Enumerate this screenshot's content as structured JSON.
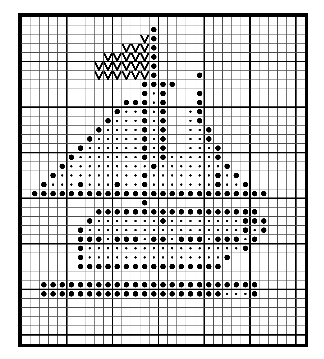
{
  "document": {
    "title": "Cross Stitch Pattern Chart",
    "caption": ""
  },
  "chart": {
    "kind": "needlework-grid-chart",
    "columns": 31,
    "rows": 36,
    "cell_size_px": 9.0,
    "major_line_every": 5,
    "colors": {
      "background": "#ffffff",
      "minor_line": "#4a4a4a",
      "major_line": "#000000",
      "border": "#000000",
      "symbol": "#000000"
    },
    "symbols": {
      "O": {
        "name": "large-filled-dot",
        "label": "large dot"
      },
      "o": {
        "name": "small-filled-dot",
        "label": "small dot"
      },
      "V": {
        "name": "v-stitch-mark",
        "label": "V"
      },
      ".": {
        "name": "empty-cell",
        "label": "empty"
      }
    },
    "legend": [
      {
        "symbol": "O",
        "name": "large-filled-dot",
        "label": "large dot"
      },
      {
        "symbol": "o",
        "name": "small-filled-dot",
        "label": "small dot"
      },
      {
        "symbol": "V",
        "name": "v-stitch-mark",
        "label": "V"
      }
    ]
  },
  "chart_data": {
    "type": "heatmap",
    "xlabel": "",
    "ylabel": "",
    "grid": true,
    "legend_position": "none",
    "categories": [],
    "values": [],
    "cells": [
      "...............................",
      "..............O................",
      ".............VO................",
      "...........VVVO................",
      ".........VVVVVO................",
      "........VVVVVVO................",
      "........VVVVVVO....O...........",
      ".............OOOO..............",
      ".............OoO...O...........",
      "...........OOOoO...O...........",
      "..........OooOoO..oO...........",
      ".........OoooOoO..oO...........",
      "........OooooOoO..ooO..........",
      ".......OoooooOoO..ooO..........",
      "......OooooooOoO..oooO.........",
      ".....OoooooooOoOoooooO.........",
      "....OoooooooooOoooooooO........",
      "...OoooooooooOoooooooOoO.......",
      "..OoooOoooOooOoooooooOooO......",
      ".OOOOOOOOOOOOOOOOOOOOOOOOOO....",
      ".............O.................",
      "........OOOOOOOOOOOOOOOOOO.....",
      ".......OoooooooOooooooooOOO....",
      "......OoooooooooooooooooOoO....",
      "......OOOoOOOoOOoOOOoOOOoO.....",
      "......OoooooooooooooooooO......",
      "......OoooooooooooooooO........",
      "......OOOOOOOOOOOOOOOO........",
      "...............................",
      "..OOOOOOOOOOOOOOOOOOOOOOOO.....",
      "..OOOOOOOOOOOOOOOOOOOOoooO.....",
      "...............................",
      "...............................",
      "...............................",
      "...............................",
      "..............................."
    ]
  }
}
